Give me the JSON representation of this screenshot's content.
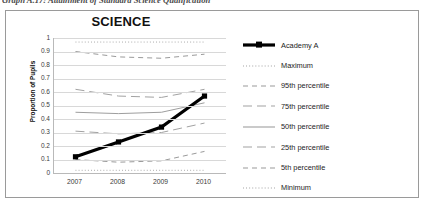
{
  "caption": {
    "text": "Graph A.17:  Attainment of Standard Science Qualification"
  },
  "chart_box": {
    "title": "SCIENCE"
  },
  "legend": {
    "position": "right",
    "items": [
      {
        "label": "Academy A",
        "style": "thick-solid-marker",
        "color": "#000000"
      },
      {
        "label": "Maximum",
        "style": "fine-dotted",
        "color": "#8d8d8d"
      },
      {
        "label": "95th percentile",
        "style": "dashed",
        "color": "#9a9a9a"
      },
      {
        "label": "75th  percentile",
        "style": "long-dash",
        "color": "#a2a2a2"
      },
      {
        "label": "50th percentile",
        "style": "solid",
        "color": "#9e9e9e"
      },
      {
        "label": "25th  percentile",
        "style": "long-dash",
        "color": "#a2a2a2"
      },
      {
        "label": "5th percentile",
        "style": "dashed",
        "color": "#9a9a9a"
      },
      {
        "label": "Minimum",
        "style": "fine-dotted",
        "color": "#8d8d8d"
      }
    ]
  },
  "chart_data": {
    "type": "line",
    "title": "SCIENCE",
    "xlabel": "",
    "ylabel": "Proportion of Pupils",
    "x": [
      "2007",
      "2008",
      "2009",
      "2010"
    ],
    "categories": [
      "2007",
      "2008",
      "2009",
      "2010"
    ],
    "ylim": [
      0,
      1
    ],
    "yticks": [
      0,
      0.1,
      0.2,
      0.3,
      0.4,
      0.5,
      0.6,
      0.7,
      0.8,
      0.9,
      1
    ],
    "ytick_labels": [
      "0",
      "0.1",
      "0.2",
      "0.3",
      "0.4",
      "0.5",
      "0.6",
      "0.7",
      "0.8",
      "0.9",
      "1"
    ],
    "grid": true,
    "grid_axis": "y",
    "legend_position": "right",
    "series": [
      {
        "name": "Academy A",
        "values": [
          0.12,
          0.23,
          0.34,
          0.57
        ],
        "marker": "square",
        "width": 3.2,
        "color": "#000000",
        "dash": "none"
      },
      {
        "name": "Maximum",
        "values": [
          0.97,
          0.97,
          0.97,
          0.97
        ],
        "marker": "none",
        "width": 0.8,
        "color": "#8d8d8d",
        "dash": "dotted"
      },
      {
        "name": "95th percentile",
        "values": [
          0.9,
          0.86,
          0.85,
          0.88
        ],
        "marker": "none",
        "width": 1.0,
        "color": "#9a9a9a",
        "dash": "dashed"
      },
      {
        "name": "75th percentile",
        "values": [
          0.62,
          0.57,
          0.56,
          0.62
        ],
        "marker": "none",
        "width": 1.0,
        "color": "#a2a2a2",
        "dash": "long-dash"
      },
      {
        "name": "50th percentile",
        "values": [
          0.45,
          0.44,
          0.45,
          0.52
        ],
        "marker": "none",
        "width": 1.0,
        "color": "#9e9e9e",
        "dash": "none"
      },
      {
        "name": "25th percentile",
        "values": [
          0.31,
          0.29,
          0.3,
          0.37
        ],
        "marker": "none",
        "width": 1.0,
        "color": "#a2a2a2",
        "dash": "long-dash"
      },
      {
        "name": "5th percentile",
        "values": [
          0.1,
          0.08,
          0.09,
          0.16
        ],
        "marker": "none",
        "width": 1.0,
        "color": "#9a9a9a",
        "dash": "dashed"
      },
      {
        "name": "Minimum",
        "values": [
          0.02,
          0.02,
          0.02,
          0.02
        ],
        "marker": "none",
        "width": 0.8,
        "color": "#8d8d8d",
        "dash": "dotted"
      }
    ]
  }
}
